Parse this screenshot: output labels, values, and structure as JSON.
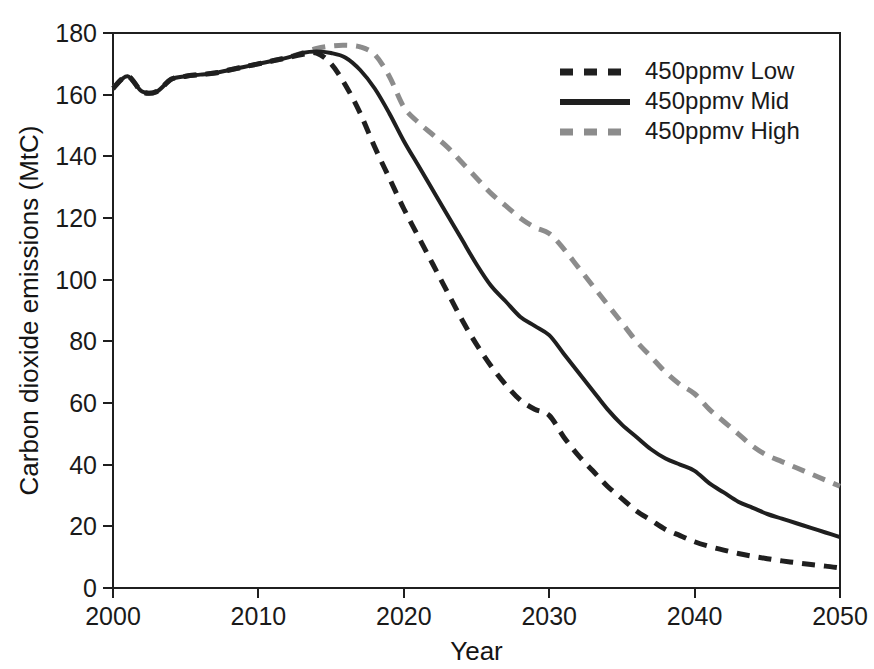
{
  "figure": {
    "background": "#ffffff",
    "plot_border_color": "#1f1f1f"
  },
  "axes": {
    "x_title": "Year",
    "y_title": "Carbon dioxide emissions (MtC)",
    "x_ticks": [
      "2000",
      "2010",
      "2020",
      "2030",
      "2040",
      "2050"
    ],
    "y_ticks": [
      "0",
      "20",
      "40",
      "60",
      "80",
      "100",
      "120",
      "140",
      "160",
      "180"
    ]
  },
  "legend": {
    "position": "top-right",
    "items": [
      {
        "label": "450ppmv Low",
        "style": "dashed",
        "color": "#1f1f1f"
      },
      {
        "label": "450ppmv Mid",
        "style": "solid",
        "color": "#1f1f1f"
      },
      {
        "label": "450ppmv High",
        "style": "dashed",
        "color": "#8c8c8c"
      }
    ]
  },
  "chart_data": {
    "type": "line",
    "title": "",
    "xlabel": "Year",
    "ylabel": "Carbon dioxide emissions (MtC)",
    "xlim": [
      2000,
      2050
    ],
    "ylim": [
      0,
      180
    ],
    "xticks": [
      2000,
      2010,
      2020,
      2030,
      2040,
      2050
    ],
    "yticks": [
      0,
      20,
      40,
      60,
      80,
      100,
      120,
      140,
      160,
      180
    ],
    "grid": false,
    "legend_position": "top-right",
    "x": [
      2000,
      2001,
      2002,
      2003,
      2004,
      2005,
      2006,
      2007,
      2008,
      2009,
      2010,
      2011,
      2012,
      2013,
      2014,
      2015,
      2016,
      2017,
      2018,
      2019,
      2020,
      2021,
      2022,
      2023,
      2024,
      2025,
      2026,
      2027,
      2028,
      2029,
      2030,
      2031,
      2032,
      2033,
      2034,
      2035,
      2036,
      2037,
      2038,
      2039,
      2040,
      2041,
      2042,
      2043,
      2044,
      2045,
      2046,
      2047,
      2048,
      2049,
      2050
    ],
    "series": [
      {
        "name": "450ppmv Low",
        "style": "dashed",
        "color": "#1f1f1f",
        "values": [
          162,
          166,
          161,
          161,
          165,
          166,
          166.5,
          167,
          168,
          169,
          170,
          171,
          172,
          173,
          173.5,
          170,
          163,
          154,
          143,
          133,
          123,
          114,
          105,
          96,
          87,
          79,
          72,
          66,
          61,
          58,
          56,
          49,
          43,
          38,
          33,
          29,
          25,
          22,
          19,
          17,
          15,
          13.5,
          12.3,
          11.2,
          10.3,
          9.5,
          8.8,
          8.2,
          7.6,
          7.1,
          6.5
        ]
      },
      {
        "name": "450ppmv Mid",
        "style": "solid",
        "color": "#1f1f1f",
        "values": [
          162,
          166,
          161,
          161,
          165,
          166,
          166.5,
          167,
          168,
          169,
          170,
          171,
          172,
          173.5,
          174,
          173.5,
          172,
          168,
          162,
          154,
          145,
          137,
          129,
          121,
          113,
          105,
          98,
          93,
          88,
          85,
          82,
          76,
          70,
          64,
          58,
          53,
          49,
          45,
          42,
          40,
          38,
          34,
          31,
          28,
          26,
          24,
          22.5,
          21,
          19.5,
          18,
          16.5
        ]
      },
      {
        "name": "450ppmv High",
        "style": "dashed",
        "color": "#8c8c8c",
        "values": [
          162,
          166,
          161,
          161,
          165,
          166,
          166.5,
          167,
          168,
          169,
          170,
          171,
          172,
          173.5,
          175,
          175.8,
          176,
          175.5,
          173,
          166,
          156,
          151,
          147,
          143,
          138,
          133,
          128,
          124,
          120,
          117,
          115,
          110,
          104,
          98,
          92,
          86,
          80,
          75,
          70,
          66,
          63,
          58,
          54,
          50,
          46,
          43,
          41,
          39,
          37,
          35,
          33
        ]
      }
    ]
  }
}
